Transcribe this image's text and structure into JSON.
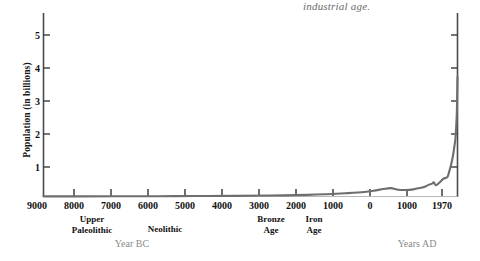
{
  "caption": "industrial age.",
  "axes": {
    "ylabel": "Population  (in billions)",
    "xlabel_bc": "Year BC",
    "xlabel_ad": "Years AD"
  },
  "chart_data": {
    "type": "line",
    "title": "",
    "subtitle": "industrial age.",
    "xlabel": "Year BC / Years AD",
    "ylabel": "Population (in billions)",
    "ylim": [
      0,
      5.6
    ],
    "yticks": [
      1,
      2,
      3,
      4,
      5
    ],
    "ytick_labels": [
      "1",
      "2",
      "3",
      "4",
      "5"
    ],
    "xlim": [
      -9000,
      1970
    ],
    "xticks": [
      -9000,
      -8000,
      -7000,
      -6000,
      -5000,
      -4000,
      -3000,
      -2000,
      -1000,
      0,
      1000,
      1970
    ],
    "xtick_labels": [
      "9000",
      "8000",
      "7000",
      "6000",
      "5000",
      "4000",
      "3000",
      "2000",
      "1000",
      "0",
      "1000",
      "1970"
    ],
    "grid": false,
    "legend": null,
    "annotations": [
      {
        "text": "Upper\nPaleolithic",
        "x": -8000,
        "where": "below-axis"
      },
      {
        "text": "Neolithic",
        "x": -4800,
        "where": "below-axis"
      },
      {
        "text": "Bronze\nAge",
        "x": -2200,
        "where": "below-axis"
      },
      {
        "text": "Iron\nAge",
        "x": -1400,
        "where": "below-axis"
      },
      {
        "text": "Year BC",
        "x": -6300,
        "where": "axis-name"
      },
      {
        "text": "Years AD",
        "x": 1100,
        "where": "axis-name"
      },
      {
        "text": "industrial age.",
        "x": 1300,
        "where": "top"
      }
    ],
    "series": [
      {
        "name": "World population",
        "color": "#6e6e6e",
        "x": [
          -9000,
          -8000,
          -7000,
          -6000,
          -5000,
          -4000,
          -3000,
          -2000,
          -1500,
          -1000,
          -500,
          -200,
          0,
          200,
          400,
          600,
          800,
          1000,
          1100,
          1200,
          1300,
          1340,
          1400,
          1500,
          1600,
          1700,
          1750,
          1800,
          1850,
          1900,
          1920,
          1950,
          1960,
          1970
        ],
        "y": [
          0.004,
          0.005,
          0.007,
          0.01,
          0.015,
          0.02,
          0.03,
          0.05,
          0.07,
          0.1,
          0.14,
          0.19,
          0.23,
          0.26,
          0.21,
          0.2,
          0.22,
          0.27,
          0.3,
          0.36,
          0.4,
          0.44,
          0.35,
          0.44,
          0.55,
          0.6,
          0.77,
          0.98,
          1.26,
          1.65,
          1.86,
          2.52,
          3.02,
          3.7
        ]
      }
    ]
  },
  "ticks": {
    "y": [
      "1",
      "2",
      "3",
      "4",
      "5"
    ],
    "x": [
      "9000",
      "8000",
      "7000",
      "6000",
      "5000",
      "4000",
      "3000",
      "2000",
      "1000",
      "0",
      "1000",
      "1970"
    ]
  },
  "eras": [
    {
      "line1": "Upper",
      "line2": "Paleolithic"
    },
    {
      "line1": "Neolithic",
      "line2": ""
    },
    {
      "line1": "Bronze",
      "line2": "Age"
    },
    {
      "line1": "Iron",
      "line2": "Age"
    }
  ],
  "colors": {
    "curve": "#6e6e6e",
    "axis": "#4a4a4a",
    "text": "#111111",
    "muted": "#8a8a8a"
  }
}
